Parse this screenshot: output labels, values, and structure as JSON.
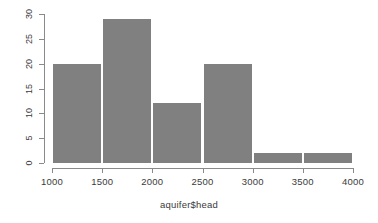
{
  "chart_data": {
    "type": "bar",
    "title": "",
    "subtitle": "",
    "xlabel": "aquifer$head",
    "ylabel": "",
    "xlim": [
      1000,
      4000
    ],
    "ylim": [
      0,
      30
    ],
    "grid": false,
    "legend": null,
    "bin_width": 500,
    "bin_edges": [
      1000,
      1500,
      2000,
      2500,
      3000,
      3500,
      4000
    ],
    "categories": [
      "1000-1500",
      "1500-2000",
      "2000-2500",
      "2500-3000",
      "3000-3500",
      "3500-4000"
    ],
    "values": [
      20,
      29,
      12,
      20,
      2,
      2
    ],
    "bars": [
      {
        "label": "1000-1500",
        "x0": 1000,
        "x1": 1500,
        "value": 20
      },
      {
        "label": "1500-2000",
        "x0": 1500,
        "x1": 2000,
        "value": 29
      },
      {
        "label": "2000-2500",
        "x0": 2000,
        "x1": 2500,
        "value": 12
      },
      {
        "label": "2500-3000",
        "x0": 2500,
        "x1": 3000,
        "value": 20
      },
      {
        "label": "3000-3500",
        "x0": 3000,
        "x1": 3500,
        "value": 2
      },
      {
        "label": "3500-4000",
        "x0": 3500,
        "x1": 4000,
        "value": 2
      }
    ],
    "x_ticks": [
      {
        "value": 1000,
        "label": "1000"
      },
      {
        "value": 1500,
        "label": "1500"
      },
      {
        "value": 2000,
        "label": "2000"
      },
      {
        "value": 2500,
        "label": "2500"
      },
      {
        "value": 3000,
        "label": "3000"
      },
      {
        "value": 3500,
        "label": "3500"
      },
      {
        "value": 4000,
        "label": "4000"
      }
    ],
    "y_ticks": [
      {
        "value": 0,
        "label": "0"
      },
      {
        "value": 5,
        "label": "5"
      },
      {
        "value": 10,
        "label": "10"
      },
      {
        "value": 15,
        "label": "15"
      },
      {
        "value": 20,
        "label": "20"
      },
      {
        "value": 25,
        "label": "25"
      },
      {
        "value": 30,
        "label": "30"
      }
    ],
    "colors": {
      "bar_fill": "#808080",
      "bar_separator": "#ffffff",
      "axis": "#8a8a8a",
      "text": "#3a3a3a",
      "background": "#ffffff"
    }
  }
}
